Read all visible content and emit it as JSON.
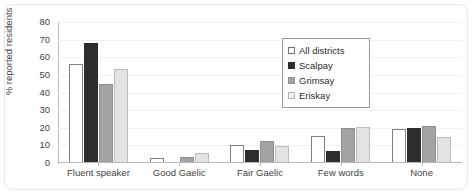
{
  "chart_data": {
    "type": "bar",
    "title": "",
    "xlabel": "",
    "ylabel": "% reported residents",
    "ylim": [
      0,
      80
    ],
    "yticks": [
      0,
      10,
      20,
      30,
      40,
      50,
      60,
      70,
      80
    ],
    "grid": true,
    "legend_position": "upper right",
    "categories": [
      "Fluent speaker",
      "Good Gaelic",
      "Fair Gaelic",
      "Few words",
      "None"
    ],
    "series": [
      {
        "name": "All districts",
        "color": "#ffffff",
        "values": [
          55.5,
          2.5,
          9.5,
          14.5,
          18.5
        ]
      },
      {
        "name": "Scalpay",
        "color": "#2d2d2d",
        "values": [
          67.5,
          0,
          7,
          6.5,
          19.5
        ]
      },
      {
        "name": "Grimsay",
        "color": "#a3a3a3",
        "values": [
          44.5,
          3,
          12,
          19.5,
          20.5
        ]
      },
      {
        "name": "Eriskay",
        "color": "#e3e3e3",
        "values": [
          52.5,
          5,
          9,
          20,
          14
        ]
      }
    ]
  },
  "axis": {
    "y_title": "% reported residents",
    "y_tick_labels": [
      "80",
      "70",
      "60",
      "50",
      "40",
      "30",
      "20",
      "10",
      "0"
    ],
    "x_tick_labels": [
      "Fluent speaker",
      "Good Gaelic",
      "Fair Gaelic",
      "Few words",
      "None"
    ]
  },
  "legend": {
    "items": [
      {
        "label": "All districts"
      },
      {
        "label": "Scalpay"
      },
      {
        "label": "Grimsay"
      },
      {
        "label": "Eriskay"
      }
    ]
  }
}
